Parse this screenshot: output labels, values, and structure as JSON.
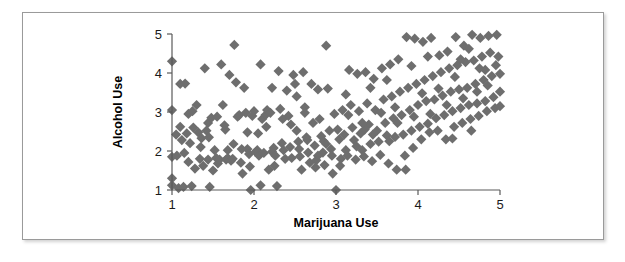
{
  "figure": {
    "background_color": "#ffffff",
    "frame_color": "#9a9a9a",
    "marker_color": "#6e6e6e",
    "axis_color": "#5a5a5a",
    "text_color": "#000000"
  },
  "axes": {
    "x_title": "Marijuana Use",
    "y_title": "Alcohol Use",
    "x_ticks": [
      "1",
      "2",
      "3",
      "4",
      "5"
    ],
    "y_ticks": [
      "1",
      "2",
      "3",
      "4",
      "5"
    ]
  },
  "chart_data": {
    "type": "scatter",
    "title": "",
    "xlabel": "Marijuana Use",
    "ylabel": "Alcohol Use",
    "xlim": [
      1,
      5
    ],
    "ylim": [
      1,
      5
    ],
    "xticks": [
      1,
      2,
      3,
      4,
      5
    ],
    "yticks": [
      1,
      2,
      3,
      4,
      5
    ],
    "grid": false,
    "legend": null,
    "marker": "diamond",
    "marker_color": "#6e6e6e",
    "marker_size": 7,
    "n_points": 256,
    "relationship": "positive",
    "points": [
      [
        1.0,
        4.3
      ],
      [
        1.0,
        3.05
      ],
      [
        1.0,
        1.85
      ],
      [
        1.0,
        1.3
      ],
      [
        1.0,
        1.12
      ],
      [
        1.05,
        2.42
      ],
      [
        1.06,
        1.88
      ],
      [
        1.08,
        1.05
      ],
      [
        1.1,
        3.72
      ],
      [
        1.1,
        2.62
      ],
      [
        1.12,
        2.28
      ],
      [
        1.14,
        1.08
      ],
      [
        1.16,
        3.73
      ],
      [
        1.18,
        2.45
      ],
      [
        1.2,
        2.95
      ],
      [
        1.2,
        1.72
      ],
      [
        1.22,
        2.2
      ],
      [
        1.24,
        1.1
      ],
      [
        1.26,
        2.6
      ],
      [
        1.28,
        1.55
      ],
      [
        1.3,
        3.18
      ],
      [
        1.32,
        2.48
      ],
      [
        1.34,
        1.8
      ],
      [
        1.36,
        2.33
      ],
      [
        1.38,
        1.62
      ],
      [
        1.4,
        4.12
      ],
      [
        1.42,
        2.52
      ],
      [
        1.44,
        2.72
      ],
      [
        1.44,
        1.78
      ],
      [
        1.46,
        1.08
      ],
      [
        1.48,
        2.85
      ],
      [
        1.5,
        1.5
      ],
      [
        1.52,
        2.02
      ],
      [
        1.54,
        1.82
      ],
      [
        1.56,
        1.68
      ],
      [
        1.58,
        1.78
      ],
      [
        1.6,
        4.22
      ],
      [
        1.62,
        3.18
      ],
      [
        1.64,
        2.66
      ],
      [
        1.66,
        1.78
      ],
      [
        1.68,
        1.82
      ],
      [
        1.7,
        3.95
      ],
      [
        1.72,
        1.75
      ],
      [
        1.74,
        1.8
      ],
      [
        1.76,
        4.72
      ],
      [
        1.78,
        3.76
      ],
      [
        1.8,
        2.88
      ],
      [
        1.82,
        2.92
      ],
      [
        1.84,
        1.7
      ],
      [
        1.86,
        1.42
      ],
      [
        1.88,
        3.62
      ],
      [
        1.9,
        2.98
      ],
      [
        1.92,
        2.05
      ],
      [
        1.94,
        1.92
      ],
      [
        1.96,
        1.0
      ],
      [
        1.98,
        2.9
      ],
      [
        2.0,
        3.02
      ],
      [
        2.02,
        1.98
      ],
      [
        2.04,
        2.02
      ],
      [
        2.06,
        1.88
      ],
      [
        2.08,
        1.12
      ],
      [
        2.1,
        2.82
      ],
      [
        2.12,
        1.95
      ],
      [
        2.14,
        2.92
      ],
      [
        2.16,
        3.05
      ],
      [
        2.18,
        1.52
      ],
      [
        2.2,
        2.98
      ],
      [
        2.22,
        1.98
      ],
      [
        2.24,
        2.08
      ],
      [
        2.26,
        1.88
      ],
      [
        2.28,
        1.1
      ],
      [
        2.3,
        4.05
      ],
      [
        2.32,
        3.08
      ],
      [
        2.34,
        2.2
      ],
      [
        2.36,
        2.02
      ],
      [
        2.38,
        1.8
      ],
      [
        2.4,
        3.55
      ],
      [
        2.42,
        2.9
      ],
      [
        2.44,
        2.1
      ],
      [
        2.46,
        1.82
      ],
      [
        2.48,
        3.95
      ],
      [
        2.5,
        3.72
      ],
      [
        2.52,
        2.52
      ],
      [
        2.54,
        2.24
      ],
      [
        2.56,
        1.86
      ],
      [
        2.58,
        1.52
      ],
      [
        2.6,
        4.02
      ],
      [
        2.62,
        3.12
      ],
      [
        2.64,
        2.35
      ],
      [
        2.66,
        1.96
      ],
      [
        2.68,
        1.7
      ],
      [
        2.7,
        3.72
      ],
      [
        2.72,
        2.72
      ],
      [
        2.74,
        2.14
      ],
      [
        2.76,
        1.76
      ],
      [
        2.78,
        3.58
      ],
      [
        2.8,
        2.82
      ],
      [
        2.82,
        2.38
      ],
      [
        2.84,
        1.96
      ],
      [
        2.86,
        1.64
      ],
      [
        2.88,
        4.7
      ],
      [
        2.9,
        3.6
      ],
      [
        2.92,
        2.52
      ],
      [
        2.94,
        2.05
      ],
      [
        2.96,
        1.42
      ],
      [
        2.98,
        2.95
      ],
      [
        3.0,
        1.0
      ],
      [
        3.02,
        2.55
      ],
      [
        3.04,
        2.3
      ],
      [
        3.06,
        1.8
      ],
      [
        3.08,
        3.05
      ],
      [
        3.1,
        2.42
      ],
      [
        3.12,
        2.02
      ],
      [
        3.14,
        1.88
      ],
      [
        3.16,
        4.08
      ],
      [
        3.18,
        3.18
      ],
      [
        3.2,
        2.6
      ],
      [
        3.22,
        2.28
      ],
      [
        3.24,
        1.78
      ],
      [
        3.26,
        3.98
      ],
      [
        3.28,
        3.02
      ],
      [
        3.3,
        2.45
      ],
      [
        3.32,
        2.02
      ],
      [
        3.34,
        1.86
      ],
      [
        3.36,
        4.02
      ],
      [
        3.38,
        3.22
      ],
      [
        3.4,
        2.68
      ],
      [
        3.42,
        2.18
      ],
      [
        3.44,
        1.74
      ],
      [
        3.46,
        3.85
      ],
      [
        3.48,
        3.05
      ],
      [
        3.5,
        2.52
      ],
      [
        3.52,
        2.24
      ],
      [
        3.54,
        1.9
      ],
      [
        3.56,
        4.12
      ],
      [
        3.58,
        3.32
      ],
      [
        3.6,
        2.72
      ],
      [
        3.62,
        2.4
      ],
      [
        3.64,
        1.68
      ],
      [
        3.66,
        4.22
      ],
      [
        3.68,
        3.4
      ],
      [
        3.7,
        2.84
      ],
      [
        3.72,
        2.36
      ],
      [
        3.74,
        1.52
      ],
      [
        3.76,
        4.35
      ],
      [
        3.78,
        3.52
      ],
      [
        3.8,
        2.92
      ],
      [
        3.82,
        2.42
      ],
      [
        3.84,
        1.88
      ],
      [
        3.86,
        4.92
      ],
      [
        3.88,
        3.62
      ],
      [
        3.9,
        3.05
      ],
      [
        3.92,
        2.52
      ],
      [
        3.94,
        2.08
      ],
      [
        3.96,
        4.88
      ],
      [
        3.98,
        3.72
      ],
      [
        4.0,
        3.18
      ],
      [
        4.02,
        2.62
      ],
      [
        4.04,
        2.3
      ],
      [
        4.06,
        4.8
      ],
      [
        4.08,
        3.82
      ],
      [
        4.1,
        3.28
      ],
      [
        4.12,
        2.7
      ],
      [
        4.14,
        2.48
      ],
      [
        4.16,
        4.9
      ],
      [
        4.18,
        3.92
      ],
      [
        4.2,
        3.32
      ],
      [
        4.22,
        2.84
      ],
      [
        4.24,
        2.52
      ],
      [
        4.26,
        4.45
      ],
      [
        4.28,
        4.02
      ],
      [
        4.3,
        3.42
      ],
      [
        4.32,
        2.92
      ],
      [
        4.34,
        2.3
      ],
      [
        4.36,
        4.55
      ],
      [
        4.38,
        4.12
      ],
      [
        4.4,
        3.52
      ],
      [
        4.42,
        3.02
      ],
      [
        4.44,
        2.62
      ],
      [
        4.46,
        4.92
      ],
      [
        4.48,
        4.2
      ],
      [
        4.5,
        3.58
      ],
      [
        4.52,
        3.1
      ],
      [
        4.54,
        2.72
      ],
      [
        4.56,
        4.7
      ],
      [
        4.58,
        4.28
      ],
      [
        4.6,
        3.62
      ],
      [
        4.62,
        3.18
      ],
      [
        4.64,
        2.82
      ],
      [
        4.66,
        4.98
      ],
      [
        4.68,
        4.32
      ],
      [
        4.7,
        3.72
      ],
      [
        4.72,
        3.22
      ],
      [
        4.74,
        2.9
      ],
      [
        4.76,
        4.9
      ],
      [
        4.78,
        4.42
      ],
      [
        4.8,
        3.82
      ],
      [
        4.82,
        3.28
      ],
      [
        4.84,
        3.02
      ],
      [
        4.86,
        4.95
      ],
      [
        4.88,
        4.52
      ],
      [
        4.9,
        3.92
      ],
      [
        4.92,
        3.38
      ],
      [
        4.94,
        3.1
      ],
      [
        4.96,
        4.98
      ],
      [
        4.98,
        4.42
      ],
      [
        5.0,
        3.98
      ],
      [
        5.0,
        3.52
      ],
      [
        5.0,
        3.15
      ],
      [
        1.15,
        1.95
      ],
      [
        1.25,
        3.02
      ],
      [
        1.35,
        2.1
      ],
      [
        1.45,
        2.35
      ],
      [
        1.55,
        2.88
      ],
      [
        1.65,
        2.55
      ],
      [
        1.75,
        2.18
      ],
      [
        1.85,
        2.05
      ],
      [
        1.95,
        1.6
      ],
      [
        2.05,
        2.45
      ],
      [
        2.15,
        2.62
      ],
      [
        2.25,
        1.62
      ],
      [
        2.35,
        2.82
      ],
      [
        2.45,
        2.68
      ],
      [
        2.55,
        2.05
      ],
      [
        2.65,
        2.28
      ],
      [
        2.75,
        1.58
      ],
      [
        2.85,
        2.25
      ],
      [
        2.95,
        1.88
      ],
      [
        3.05,
        1.62
      ],
      [
        3.15,
        2.92
      ],
      [
        3.25,
        2.12
      ],
      [
        3.35,
        2.55
      ],
      [
        3.45,
        2.42
      ],
      [
        3.55,
        2.98
      ],
      [
        3.65,
        2.25
      ],
      [
        3.75,
        2.72
      ],
      [
        3.85,
        1.52
      ],
      [
        3.95,
        2.88
      ],
      [
        4.05,
        3.48
      ],
      [
        4.15,
        2.95
      ],
      [
        4.25,
        3.6
      ],
      [
        4.35,
        3.18
      ],
      [
        4.45,
        3.9
      ],
      [
        4.55,
        3.35
      ],
      [
        4.65,
        2.52
      ],
      [
        4.75,
        4.12
      ],
      [
        4.85,
        3.68
      ],
      [
        4.95,
        4.2
      ],
      [
        2.08,
        4.22
      ],
      [
        2.52,
        3.4
      ],
      [
        3.12,
        3.45
      ],
      [
        3.62,
        3.82
      ],
      [
        4.12,
        4.42
      ],
      [
        4.62,
        4.62
      ],
      [
        1.92,
        2.48
      ],
      [
        2.62,
        2.98
      ],
      [
        3.32,
        2.72
      ],
      [
        4.42,
        2.32
      ],
      [
        4.72,
        3.52
      ],
      [
        2.22,
        3.62
      ],
      [
        2.88,
        2.18
      ],
      [
        3.42,
        3.62
      ],
      [
        3.92,
        4.18
      ],
      [
        4.52,
        4.35
      ],
      [
        1.68,
        2.02
      ],
      [
        2.78,
        1.88
      ],
      [
        3.72,
        3.12
      ],
      [
        4.82,
        4.08
      ]
    ]
  }
}
